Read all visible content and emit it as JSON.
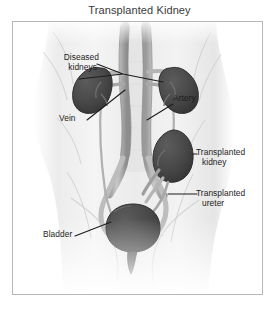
{
  "figure": {
    "title": "Transplanted Kidney",
    "frame_color": "#b6b6b6",
    "background_color": "#ffffff"
  },
  "illustration": {
    "description": "Grayscale anatomical drawing of a human abdomen and pelvis viewed from the front, showing two dark diseased kidneys high on either side of the aorta and inferior vena cava, a transplanted kidney placed low in the right pelvis, and the bladder at the bottom center.",
    "organ_color": "#4a4a4a",
    "organ_outline_color": "#2c2c2c",
    "vessel_color": "#6e6e6e",
    "body_tone_color": "#d8d8d8",
    "leader_line_color": "#1d1d1d",
    "organs": [
      {
        "name": "diseased-kidney-left",
        "label_ref": "diseased_kidneys"
      },
      {
        "name": "diseased-kidney-right",
        "label_ref": "diseased_kidneys"
      },
      {
        "name": "transplanted-kidney",
        "label_ref": "transplanted_kidney"
      },
      {
        "name": "bladder",
        "label_ref": "bladder"
      }
    ],
    "vessels": [
      {
        "name": "aorta",
        "label_ref": "artery"
      },
      {
        "name": "inferior-vena-cava",
        "label_ref": "vein"
      },
      {
        "name": "transplanted-ureter",
        "label_ref": "transplanted_ureter"
      }
    ]
  },
  "labels": {
    "diseased_kidneys": {
      "line1": "Diseased",
      "line2": "kidneys"
    },
    "vein": {
      "line1": "Vein",
      "line2": ""
    },
    "artery": {
      "line1": "Artery",
      "line2": ""
    },
    "transplanted_kidney": {
      "line1": "Transplanted",
      "line2": "kidney"
    },
    "transplanted_ureter": {
      "line1": "Transplanted",
      "line2": "ureter"
    },
    "bladder": {
      "line1": "Bladder",
      "line2": ""
    }
  }
}
